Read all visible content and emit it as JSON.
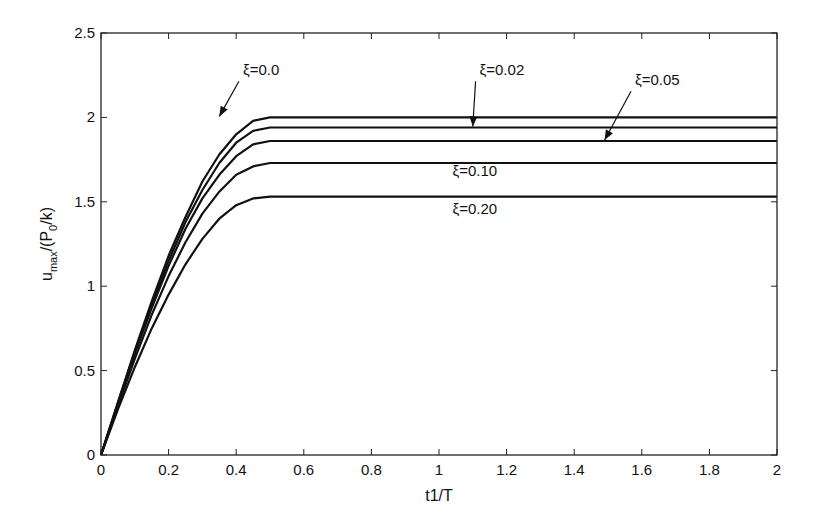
{
  "chart_data": {
    "type": "line",
    "title": "",
    "xlabel": "t1/T",
    "ylabel": "u_max/(P_0/k)",
    "xlim": [
      0,
      2
    ],
    "ylim": [
      0,
      2.5
    ],
    "grid": false,
    "legend": "none (inline annotations with arrows)",
    "xticks": [
      "0",
      "0.2",
      "0.4",
      "0.6",
      "0.8",
      "1",
      "1.2",
      "1.4",
      "1.6",
      "1.8",
      "2"
    ],
    "yticks": [
      "0",
      "0.5",
      "1",
      "1.5",
      "2",
      "2.5"
    ],
    "x": [
      0,
      0.05,
      0.1,
      0.15,
      0.2,
      0.25,
      0.3,
      0.35,
      0.4,
      0.45,
      0.5,
      0.6,
      0.8,
      1.0,
      1.2,
      1.4,
      1.6,
      1.8,
      2.0
    ],
    "series": [
      {
        "name": "ξ=0.0",
        "values": [
          0,
          0.31,
          0.62,
          0.91,
          1.18,
          1.41,
          1.62,
          1.78,
          1.9,
          1.98,
          2.0,
          2.0,
          2.0,
          2.0,
          2.0,
          2.0,
          2.0,
          2.0,
          2.0
        ]
      },
      {
        "name": "ξ=0.02",
        "values": [
          0,
          0.31,
          0.61,
          0.89,
          1.15,
          1.38,
          1.57,
          1.73,
          1.85,
          1.92,
          1.94,
          1.94,
          1.94,
          1.94,
          1.94,
          1.94,
          1.94,
          1.94,
          1.94
        ]
      },
      {
        "name": "ξ=0.05",
        "values": [
          0,
          0.3,
          0.6,
          0.87,
          1.12,
          1.34,
          1.52,
          1.66,
          1.77,
          1.84,
          1.86,
          1.86,
          1.86,
          1.86,
          1.86,
          1.86,
          1.86,
          1.86,
          1.86
        ]
      },
      {
        "name": "ξ=0.10",
        "values": [
          0,
          0.29,
          0.57,
          0.83,
          1.06,
          1.26,
          1.43,
          1.56,
          1.66,
          1.71,
          1.73,
          1.73,
          1.73,
          1.73,
          1.73,
          1.73,
          1.73,
          1.73,
          1.73
        ]
      },
      {
        "name": "ξ=0.20",
        "values": [
          0,
          0.27,
          0.52,
          0.75,
          0.95,
          1.13,
          1.28,
          1.4,
          1.48,
          1.52,
          1.53,
          1.53,
          1.53,
          1.53,
          1.53,
          1.53,
          1.53,
          1.53,
          1.53
        ]
      }
    ],
    "annotations": [
      {
        "text": "ξ=0.0",
        "series": "ξ=0.0",
        "arrow": true,
        "text_x": 0.42,
        "text_y": 2.25,
        "arrow_to_x": 0.35,
        "arrow_to_y": 2.0
      },
      {
        "text": "ξ=0.02",
        "series": "ξ=0.02",
        "arrow": true,
        "text_x": 1.12,
        "text_y": 2.25,
        "arrow_to_x": 1.1,
        "arrow_to_y": 1.94
      },
      {
        "text": "ξ=0.05",
        "series": "ξ=0.05",
        "arrow": true,
        "text_x": 1.58,
        "text_y": 2.19,
        "arrow_to_x": 1.49,
        "arrow_to_y": 1.86
      },
      {
        "text": "ξ=0.10",
        "series": "ξ=0.10",
        "arrow": false,
        "text_x": 1.04,
        "text_y": 1.65,
        "arrow_to_x": null,
        "arrow_to_y": null
      },
      {
        "text": "ξ=0.20",
        "series": "ξ=0.20",
        "arrow": false,
        "text_x": 1.04,
        "text_y": 1.43,
        "arrow_to_x": null,
        "arrow_to_y": null
      }
    ]
  },
  "colors": {
    "line": "#111111",
    "axis": "#222222",
    "background": "#ffffff"
  },
  "plot_box": {
    "left": 101,
    "top": 33,
    "right": 777,
    "bottom": 455
  }
}
